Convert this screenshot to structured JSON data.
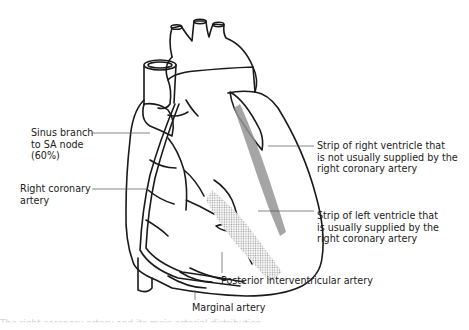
{
  "figure": {
    "labels": {
      "sinus_branch": "Sinus branch\nto SA node\n(60%)",
      "right_coronary": "Right coronary\nartery",
      "strip_right_ventricle": "Strip of right ventricle that\nis not usually supplied by the\nright coronary artery",
      "strip_left_ventricle": "Strip of left ventricle that\nis usually supplied by the\nright coronary artery",
      "posterior_interventricular": "Posterior interventricular artery",
      "marginal": "Marginal artery"
    },
    "caption_cut": "The right coronary artery and its main arterial distribution",
    "colors": {
      "line": "#1a1a1a",
      "leader": "#555555",
      "shading_dark": "#8a8a8a",
      "shading_light": "#c4c4c4"
    }
  }
}
